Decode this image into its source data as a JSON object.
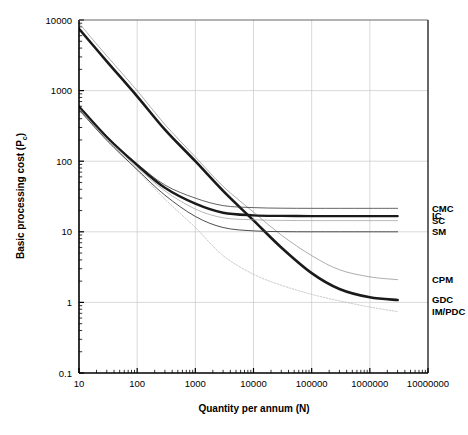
{
  "chart_data": {
    "type": "line",
    "title": "",
    "xlabel": "Quantity per annum (N)",
    "ylabel": "Basic processing cost (Pc)",
    "ylabel_main": "Basic processing cost (P",
    "ylabel_sub": "c",
    "ylabel_tail": ")",
    "xscale": "log",
    "yscale": "log",
    "xlim": [
      10,
      10000000
    ],
    "ylim": [
      0.1,
      10000
    ],
    "grid": true,
    "legend_position": "right-inline",
    "xticks": [
      "10",
      "100",
      "1000",
      "10000",
      "100000",
      "1000000",
      "10000000"
    ],
    "xtick_values": [
      10,
      100,
      1000,
      10000,
      100000,
      1000000,
      10000000
    ],
    "yticks": [
      "10000",
      "1000",
      "100",
      "10",
      "1",
      "0.1"
    ],
    "ytick_values": [
      10000,
      1000,
      100,
      10,
      1,
      0.1
    ],
    "series": [
      {
        "name": "CPM",
        "label": "CPM",
        "style": "thin-solid",
        "color": "#8a8a8a",
        "width": 0.7,
        "x": [
          10,
          30,
          100,
          300,
          1000,
          3000,
          10000,
          30000,
          100000,
          300000,
          1000000,
          3000000
        ],
        "values": [
          9000,
          3100,
          1000,
          330,
          115,
          44,
          19,
          9.0,
          4.6,
          2.9,
          2.3,
          2.1
        ]
      },
      {
        "name": "GDC",
        "label": "GDC",
        "style": "thick-solid",
        "color": "#1a1a1a",
        "width": 2.6,
        "x": [
          10,
          30,
          100,
          300,
          1000,
          3000,
          10000,
          30000,
          100000,
          300000,
          1000000,
          3000000
        ],
        "values": [
          7500,
          2600,
          830,
          280,
          100,
          38,
          14.5,
          6.0,
          2.6,
          1.55,
          1.18,
          1.08
        ]
      },
      {
        "name": "IM/PDC",
        "label": "IM/PDC",
        "style": "dotted",
        "color": "#b0b0b0",
        "width": 0.7,
        "x": [
          10,
          30,
          100,
          300,
          1000,
          3000,
          10000,
          30000,
          100000,
          300000,
          1000000,
          3000000
        ],
        "values": [
          520,
          200,
          74,
          29,
          11.5,
          4.6,
          2.5,
          1.75,
          1.3,
          1.05,
          0.86,
          0.74
        ]
      },
      {
        "name": "CMC",
        "label": "CMC",
        "style": "thin-solid",
        "color": "#3a3a3a",
        "width": 0.8,
        "x": [
          10,
          30,
          100,
          300,
          1000,
          3000,
          10000,
          30000,
          100000,
          300000,
          1000000,
          3000000
        ],
        "values": [
          600,
          225,
          92,
          46,
          30,
          23.5,
          22.0,
          21.6,
          21.5,
          21.5,
          21.5,
          21.5
        ]
      },
      {
        "name": "IC",
        "label": "IC",
        "style": "thick-solid",
        "color": "#1a1a1a",
        "width": 2.4,
        "x": [
          10,
          30,
          100,
          300,
          1000,
          3000,
          10000,
          30000,
          100000,
          300000,
          1000000,
          3000000
        ],
        "values": [
          595,
          220,
          88,
          42,
          25.0,
          18.6,
          17.1,
          16.8,
          16.7,
          16.7,
          16.7,
          16.7
        ]
      },
      {
        "name": "SC",
        "label": "SC",
        "style": "thin-solid",
        "color": "#9a9a9a",
        "width": 0.7,
        "x": [
          10,
          30,
          100,
          300,
          1000,
          3000,
          10000,
          30000,
          100000,
          300000,
          1000000,
          3000000
        ],
        "values": [
          560,
          208,
          82,
          38,
          21.0,
          15.8,
          14.8,
          14.5,
          14.4,
          14.4,
          14.4,
          14.4
        ]
      },
      {
        "name": "SM",
        "label": "SM",
        "style": "thin-solid",
        "color": "#3a3a3a",
        "width": 0.9,
        "x": [
          10,
          30,
          100,
          300,
          1000,
          3000,
          10000,
          30000,
          100000,
          300000,
          1000000,
          3000000
        ],
        "values": [
          540,
          198,
          76,
          33,
          16.5,
          11.5,
          10.3,
          10.05,
          10.0,
          10.0,
          10.0,
          10.0
        ]
      }
    ],
    "labels_right": [
      {
        "text": "CMC",
        "value": 21.5
      },
      {
        "text": "IC",
        "value": 16.7
      },
      {
        "text": "SC",
        "value": 14.4
      },
      {
        "text": "SM",
        "value": 10.0
      },
      {
        "text": "CPM",
        "value": 2.1
      },
      {
        "text": "GDC",
        "value": 1.08
      },
      {
        "text": "IM/PDC",
        "value": 0.74
      }
    ]
  }
}
